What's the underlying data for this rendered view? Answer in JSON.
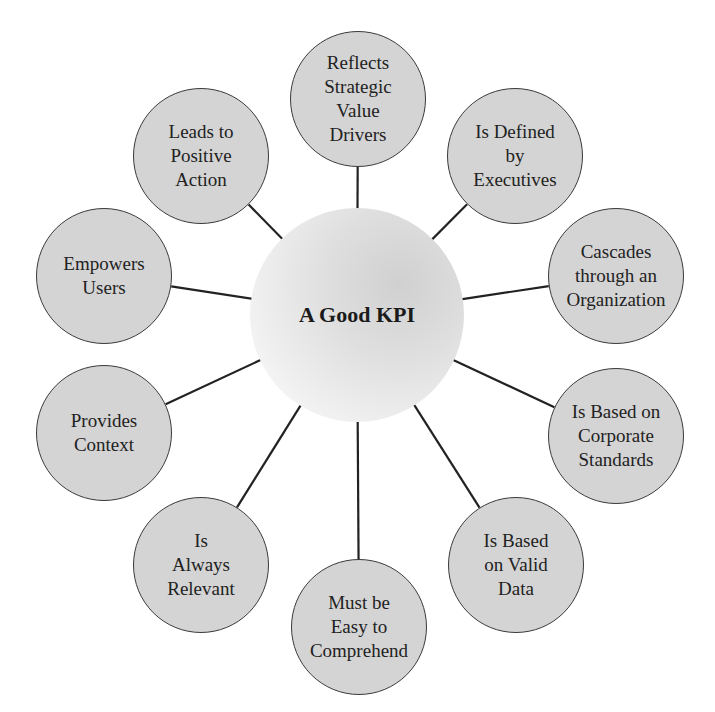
{
  "diagram": {
    "title": "A Good KPI",
    "center": {
      "label": "A Good KPI",
      "x": 357,
      "y": 315,
      "r": 107
    },
    "colors": {
      "node_fill": "#d4d4d4",
      "node_stroke": "#3a3a3a",
      "line": "#222222",
      "text": "#222222"
    },
    "nodes": [
      {
        "label": "Reflects\nStrategic\nValue\nDrivers",
        "x": 358,
        "y": 99,
        "r": 68
      },
      {
        "label": "Is Defined\nby\nExecutives",
        "x": 515,
        "y": 156,
        "r": 68
      },
      {
        "label": "Cascades\nthrough an\nOrganization",
        "x": 616,
        "y": 276,
        "r": 68
      },
      {
        "label": "Is Based on\nCorporate\nStandards",
        "x": 616,
        "y": 436,
        "r": 68
      },
      {
        "label": "Is Based\non Valid\nData",
        "x": 516,
        "y": 565,
        "r": 68
      },
      {
        "label": "Must be\nEasy to\nComprehend",
        "x": 359,
        "y": 627,
        "r": 68
      },
      {
        "label": "Is\nAlways\nRelevant",
        "x": 201,
        "y": 565,
        "r": 68
      },
      {
        "label": "Provides\nContext",
        "x": 104,
        "y": 433,
        "r": 68
      },
      {
        "label": "Empowers\nUsers",
        "x": 104,
        "y": 276,
        "r": 68
      },
      {
        "label": "Leads to\nPositive\nAction",
        "x": 201,
        "y": 156,
        "r": 68
      }
    ]
  }
}
